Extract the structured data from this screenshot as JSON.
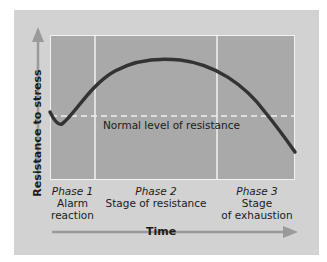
{
  "diagram": {
    "y_axis_label": "Resistance to stress",
    "x_axis_label": "Time",
    "baseline_label": "Normal level of resistance",
    "phases": [
      {
        "phase": "Phase 1",
        "line1": "Alarm",
        "line2": "reaction"
      },
      {
        "phase": "Phase 2",
        "line1": "Stage of resistance",
        "line2": ""
      },
      {
        "phase": "Phase 3",
        "line1": "Stage",
        "line2": "of exhaustion"
      }
    ],
    "colors": {
      "panel": "#d2d2d2",
      "plot": "#a9a9a9",
      "curve": "#333333",
      "grid": "#f2f2f2",
      "arrow": "#999999"
    }
  }
}
